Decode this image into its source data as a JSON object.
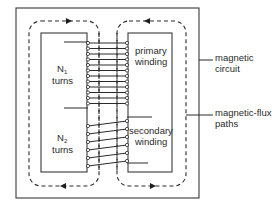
{
  "diagram": {
    "left_window": {
      "primary_count_symbol": "N",
      "primary_count_subscript": "1",
      "primary_count_unit": "turns",
      "secondary_count_symbol": "N",
      "secondary_count_subscript": "2",
      "secondary_count_unit": "turns"
    },
    "right_window": {
      "primary_label_line1": "primary",
      "primary_label_line2": "winding",
      "secondary_label_line1": "secondary",
      "secondary_label_line2": "winding"
    },
    "callouts": {
      "magnetic_circuit_line1": "magnetic",
      "magnetic_circuit_line2": "circuit",
      "flux_paths_line1": "magnetic-flux",
      "flux_paths_line2": "paths"
    },
    "flux_directions": {
      "left_loop_top": "right",
      "left_loop_bottom": "left",
      "right_loop_top": "left",
      "right_loop_bottom": "right"
    },
    "colors": {
      "line": "#2a2a2a",
      "background": "#ffffff"
    }
  }
}
